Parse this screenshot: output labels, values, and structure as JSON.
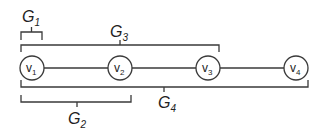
{
  "diagram": {
    "nodes": [
      {
        "id": "v1",
        "base": "v",
        "sub": "1",
        "cx": 32,
        "cy": 68,
        "r": 12
      },
      {
        "id": "v2",
        "base": "v",
        "sub": "2",
        "cx": 120,
        "cy": 68,
        "r": 12
      },
      {
        "id": "v3",
        "base": "v",
        "sub": "3",
        "cx": 208,
        "cy": 68,
        "r": 12
      },
      {
        "id": "v4",
        "base": "v",
        "sub": "4",
        "cx": 296,
        "cy": 68,
        "r": 12
      }
    ],
    "edges": [
      {
        "from": "v1",
        "to": "v2"
      },
      {
        "from": "v2",
        "to": "v3"
      },
      {
        "from": "v3",
        "to": "v4"
      }
    ],
    "groups": [
      {
        "id": "G1",
        "base": "G",
        "sub": "1",
        "members": [
          "v1"
        ],
        "position": "above"
      },
      {
        "id": "G3",
        "base": "G",
        "sub": "3",
        "members": [
          "v1",
          "v2",
          "v3"
        ],
        "position": "above"
      },
      {
        "id": "G2",
        "base": "G",
        "sub": "2",
        "members": [
          "v1",
          "v2"
        ],
        "position": "below"
      },
      {
        "id": "G4",
        "base": "G",
        "sub": "4",
        "members": [
          "v1",
          "v2",
          "v3",
          "v4"
        ],
        "position": "below"
      }
    ]
  }
}
